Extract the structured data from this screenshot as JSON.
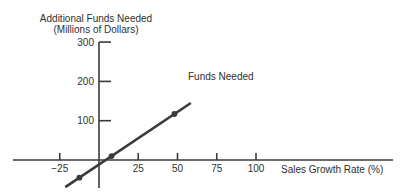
{
  "labels": {
    "title_line1": "Additional Funds Needed",
    "title_line2": "(Millions of Dollars)",
    "series_annotation": "Funds Needed",
    "x_axis_label": "Sales Growth Rate (%)"
  },
  "colors": {
    "ink": "#3a3a3a",
    "text": "#2f2f2f",
    "background": "#ffffff"
  },
  "chart_data": {
    "type": "line",
    "title": "Additional Funds Needed",
    "subtitle": "(Millions of Dollars)",
    "xlabel": "Sales Growth Rate (%)",
    "ylabel": "Additional Funds Needed (Millions of Dollars)",
    "grid": false,
    "legend_position": "inline annotation near line",
    "x_ticks": [
      -25,
      25,
      50,
      75,
      100
    ],
    "x_tick_labels": [
      "−25",
      "25",
      "50",
      "75",
      "100"
    ],
    "y_ticks": [
      300,
      200,
      100
    ],
    "y_tick_labels": [
      "300",
      "200",
      "100"
    ],
    "xlim": [
      -53,
      185
    ],
    "ylim": [
      -70,
      300
    ],
    "series": [
      {
        "name": "Funds Needed",
        "line_endpoints": [
          {
            "x": -21.5,
            "y": -69
          },
          {
            "x": 58.5,
            "y": 145
          }
        ],
        "marked_points": [
          {
            "x": -12.5,
            "y": -45
          },
          {
            "x": 8,
            "y": 10
          },
          {
            "x": 48,
            "y": 117
          }
        ],
        "x_intercept_approx": 4
      }
    ]
  }
}
